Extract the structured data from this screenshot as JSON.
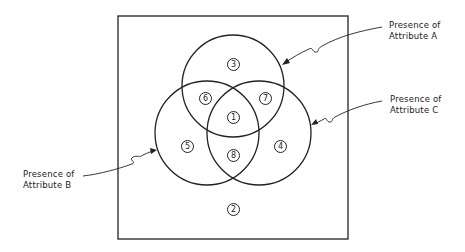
{
  "diagram": {
    "type": "venn",
    "sets": [
      {
        "id": "A",
        "label_line1": "Presence of",
        "label_line2": "Attribute A"
      },
      {
        "id": "B",
        "label_line1": "Presence of",
        "label_line2": "Attribute B"
      },
      {
        "id": "C",
        "label_line1": "Presence of",
        "label_line2": "Attribute C"
      }
    ],
    "regions": [
      {
        "number": "1",
        "sets": "A∩B∩C"
      },
      {
        "number": "2",
        "sets": "none"
      },
      {
        "number": "3",
        "sets": "A only"
      },
      {
        "number": "4",
        "sets": "C only"
      },
      {
        "number": "5",
        "sets": "B only"
      },
      {
        "number": "6",
        "sets": "A∩B"
      },
      {
        "number": "7",
        "sets": "A∩C"
      },
      {
        "number": "8",
        "sets": "B∩C"
      }
    ],
    "colors": {
      "stroke": "#222222",
      "background": "#ffffff"
    }
  }
}
